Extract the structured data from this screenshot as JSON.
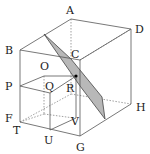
{
  "diagram": {
    "type": "cube-cross-section",
    "plane_fill": "#b8b8b8",
    "vertex_labels": {
      "A": "A",
      "B": "B",
      "C": "C",
      "D": "D",
      "F": "F",
      "G": "G",
      "H": "H",
      "O": "O",
      "P": "P",
      "Q": "Q",
      "R": "R",
      "T": "T",
      "U": "U",
      "V": "V"
    }
  }
}
